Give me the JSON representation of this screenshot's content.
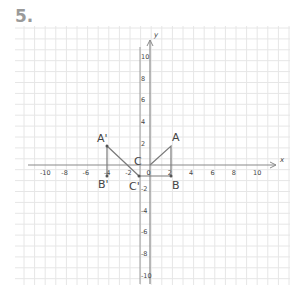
{
  "problem_number": "5.",
  "axes": {
    "x_label": "x",
    "y_label": "y",
    "x_ticks": [
      "-10",
      "-8",
      "-6",
      "-4",
      "-2",
      "0",
      "2",
      "4",
      "6",
      "8",
      "10"
    ],
    "y_ticks_positive": [
      "10",
      "8",
      "6",
      "4",
      "2"
    ],
    "y_ticks_negative": [
      "-2",
      "-4",
      "-6",
      "-8",
      "-10"
    ]
  },
  "points": {
    "A": "A",
    "B": "B",
    "C": "C",
    "A_prime": "A'",
    "B_prime": "B'",
    "C_prime": "C'"
  },
  "colors": {
    "grid": "#e4e4e4",
    "axis": "#8a8a8a",
    "shape": "#7a7a7a",
    "text": "#444444"
  }
}
